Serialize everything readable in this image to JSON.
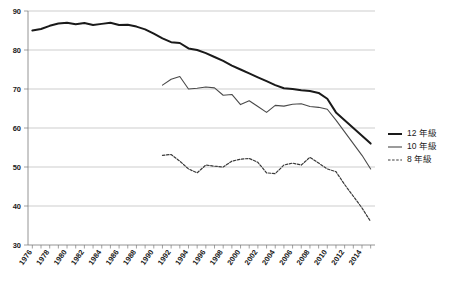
{
  "chart_data": {
    "type": "line",
    "title": "",
    "subtitle": "",
    "xlabel": "",
    "ylabel": "",
    "xlim": [
      1975.5,
      2015.5
    ],
    "ylim": [
      30,
      90
    ],
    "grid": true,
    "legend_position": "right",
    "y_ticks": [
      30,
      40,
      50,
      60,
      70,
      80,
      90
    ],
    "x_ticks": [
      1976,
      1978,
      1980,
      1982,
      1984,
      1986,
      1988,
      1990,
      1992,
      1994,
      1996,
      1998,
      2000,
      2002,
      2004,
      2006,
      2008,
      2010,
      2012,
      2014
    ],
    "x_tick_labels": [
      "1976",
      "1978",
      "1980",
      "1982",
      "1984",
      "1986",
      "1988",
      "1990",
      "1992",
      "1994",
      "1996",
      "1998",
      "2000",
      "2002",
      "2004",
      "2006",
      "2008",
      "2010",
      "2012",
      "2014"
    ],
    "series": [
      {
        "name": "12 年級",
        "style": "thick-solid",
        "color": "#1a1a1a",
        "x": [
          1976,
          1977,
          1978,
          1979,
          1980,
          1981,
          1982,
          1983,
          1984,
          1985,
          1986,
          1987,
          1988,
          1989,
          1990,
          1991,
          1992,
          1993,
          1994,
          1995,
          1996,
          1997,
          1998,
          1999,
          2000,
          2001,
          2002,
          2003,
          2004,
          2005,
          2006,
          2007,
          2008,
          2009,
          2010,
          2011,
          2012,
          2013,
          2014,
          2015
        ],
        "values": [
          85.0,
          85.4,
          86.2,
          86.8,
          87.0,
          86.6,
          86.9,
          86.4,
          86.7,
          87.0,
          86.4,
          86.5,
          86.0,
          85.3,
          84.2,
          83.0,
          82.0,
          81.8,
          80.4,
          80.0,
          79.2,
          78.2,
          77.2,
          76.0,
          75.0,
          74.0,
          73.0,
          72.0,
          71.0,
          70.2,
          70.0,
          69.7,
          69.5,
          69.0,
          67.5,
          64.0,
          62.0,
          60.0,
          58.0,
          56.0
        ]
      },
      {
        "name": "10 年級",
        "style": "thin-solid",
        "color": "#4a4a4a",
        "x": [
          1991,
          1992,
          1993,
          1994,
          1995,
          1996,
          1997,
          1998,
          1999,
          2000,
          2001,
          2002,
          2003,
          2004,
          2005,
          2006,
          2007,
          2008,
          2009,
          2010,
          2011,
          2012,
          2013,
          2014,
          2015
        ],
        "values": [
          71.0,
          72.5,
          73.2,
          70.0,
          70.2,
          70.5,
          70.3,
          68.4,
          68.6,
          66.0,
          67.0,
          65.5,
          64.0,
          65.8,
          65.6,
          66.1,
          66.2,
          65.5,
          65.3,
          64.8,
          62.0,
          59.0,
          56.0,
          53.0,
          49.5
        ]
      },
      {
        "name": "8 年級",
        "style": "dashed",
        "color": "#3a3a3a",
        "x": [
          1991,
          1992,
          1993,
          1994,
          1995,
          1996,
          1997,
          1998,
          1999,
          2000,
          2001,
          2002,
          2003,
          2004,
          2005,
          2006,
          2007,
          2008,
          2009,
          2010,
          2011,
          2012,
          2013,
          2014,
          2015
        ],
        "values": [
          53.0,
          53.2,
          51.5,
          49.5,
          48.5,
          50.5,
          50.2,
          50.0,
          51.5,
          52.0,
          52.2,
          51.2,
          48.5,
          48.3,
          50.5,
          51.0,
          50.5,
          52.5,
          51.0,
          49.5,
          48.8,
          45.5,
          42.5,
          39.5,
          36.0
        ]
      }
    ]
  },
  "legend": {
    "entries": [
      {
        "label": "12 年級"
      },
      {
        "label": "10 年級"
      },
      {
        "label": "8 年級"
      }
    ]
  }
}
